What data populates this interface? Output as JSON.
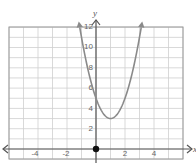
{
  "chart_data": {
    "type": "line",
    "title": "",
    "xlabel": "x",
    "ylabel": "y",
    "xlim": [
      -6,
      6
    ],
    "ylim": [
      -1,
      12
    ],
    "grid": true,
    "x_ticks": [
      -4,
      -2,
      2,
      4
    ],
    "y_ticks": [
      2,
      4,
      6,
      8,
      10,
      12
    ],
    "series": [
      {
        "name": "parabola",
        "equation": "y = 2(x - 1)^2 + 3",
        "vertex": [
          1,
          3
        ],
        "y_intercept": 5,
        "x": [
          -1.2,
          -1,
          0,
          1,
          2,
          3,
          3.2
        ],
        "y": [
          12.7,
          11,
          5,
          3,
          5,
          11,
          12.7
        ],
        "color": "#8a8a8a"
      }
    ],
    "points": [
      {
        "x": 0,
        "y": 0,
        "label": "origin"
      }
    ]
  },
  "labels": {
    "x_axis": "x",
    "y_axis": "y",
    "xt": [
      "-4",
      "-2",
      "2",
      "4"
    ],
    "yt": [
      "2",
      "4",
      "6",
      "8",
      "10",
      "12"
    ]
  },
  "colors": {
    "grid": "#cfcfcf",
    "axis": "#555555",
    "curve": "#8a8a8a",
    "border": "#9a9a9a"
  }
}
